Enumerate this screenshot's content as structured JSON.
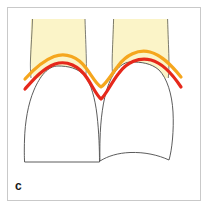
{
  "figure": {
    "panel_label": "c",
    "frame": {
      "border_color": "#c9c9c9",
      "background": "#ffffff"
    },
    "colors": {
      "gingiva_fill": "#fbf4c8",
      "gingiva_stroke": "#d8cf9a",
      "tooth_outline": "#4a4a4a",
      "tooth_fill": "#ffffff",
      "orange_curve": "#f5a61e",
      "red_curve": "#e6281b",
      "label_text": "#1a1a1a"
    },
    "elements": [
      {
        "name": "gingiva-block-left",
        "type": "gingival-tissue",
        "color": "#fbf4c8",
        "x": 31,
        "y": 19,
        "width": 54,
        "height": 58
      },
      {
        "name": "gingiva-block-right",
        "type": "gingival-tissue",
        "color": "#fbf4c8",
        "x": 113,
        "y": 19,
        "width": 55,
        "height": 58
      },
      {
        "name": "tooth-left",
        "type": "tooth-crown-outline",
        "color": "#4a4a4a",
        "apex_y": 66,
        "base_y": 162
      },
      {
        "name": "tooth-right",
        "type": "tooth-crown-outline",
        "color": "#4a4a4a",
        "apex_y": 62,
        "base_y": 160
      },
      {
        "name": "orange-contour-line",
        "type": "gingival-margin-curve",
        "color": "#f5a61e",
        "stroke_width": 3.2,
        "x_start": 25,
        "x_end": 181
      },
      {
        "name": "red-contour-line",
        "type": "bone-level-curve",
        "color": "#e6281b",
        "stroke_width": 3.2,
        "x_start": 25,
        "x_end": 181
      }
    ]
  }
}
